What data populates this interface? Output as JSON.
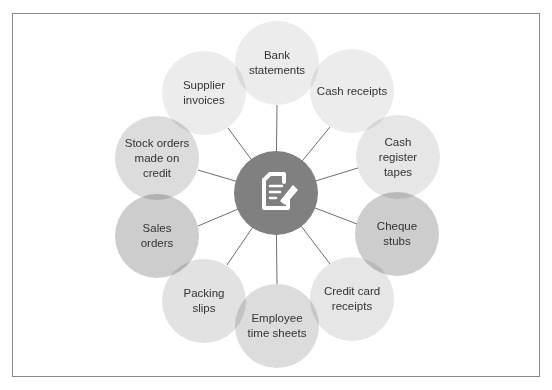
{
  "diagram": {
    "center": {
      "x": 276,
      "y": 193,
      "r": 42,
      "color": "#808080",
      "icon": "document-edit-icon"
    },
    "nodes": [
      {
        "id": "bank-statements",
        "label": "Bank statements",
        "x": 277,
        "y": 63,
        "r": 42,
        "color": "#ececec"
      },
      {
        "id": "cash-receipts",
        "label": "Cash receipts",
        "x": 352,
        "y": 91,
        "r": 42,
        "color": "#ececec"
      },
      {
        "id": "cash-register-tapes",
        "label": "Cash register tapes",
        "x": 398,
        "y": 157,
        "r": 42,
        "color": "#e6e6e6"
      },
      {
        "id": "cheque-stubs",
        "label": "Cheque stubs",
        "x": 397,
        "y": 234,
        "r": 42,
        "color": "#cdcdcd"
      },
      {
        "id": "credit-card-receipts",
        "label": "Credit card receipts",
        "x": 352,
        "y": 299,
        "r": 42,
        "color": "#e6e6e6"
      },
      {
        "id": "employee-time-sheets",
        "label": "Employee time sheets",
        "x": 277,
        "y": 326,
        "r": 42,
        "color": "#dcdcdc"
      },
      {
        "id": "packing-slips",
        "label": "Packing slips",
        "x": 204,
        "y": 301,
        "r": 42,
        "color": "#e2e2e2"
      },
      {
        "id": "sales-orders",
        "label": "Sales orders",
        "x": 157,
        "y": 236,
        "r": 42,
        "color": "#cdcdcd"
      },
      {
        "id": "stock-orders-on-credit",
        "label": "Stock orders made on credit",
        "x": 157,
        "y": 158,
        "r": 42,
        "color": "#dcdcdc"
      },
      {
        "id": "supplier-invoices",
        "label": "Supplier invoices",
        "x": 204,
        "y": 93,
        "r": 42,
        "color": "#ececec"
      }
    ]
  },
  "labels": {
    "n0": "Bank statements",
    "n1": "Cash receipts",
    "n2": "Cash register tapes",
    "n3": "Cheque stubs",
    "n4": "Credit card receipts",
    "n5": "Employee time sheets",
    "n6": "Packing slips",
    "n7": "Sales orders",
    "n8": "Stock orders made on credit",
    "n9": "Supplier invoices"
  }
}
